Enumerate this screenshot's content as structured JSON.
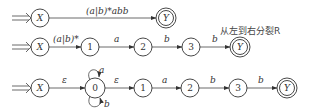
{
  "note": "从左到右分裂R",
  "rows": [
    {
      "nodes": [
        {
          "id": "X",
          "label": "X",
          "x": 40,
          "y": 18,
          "final": false,
          "start": true
        },
        {
          "id": "Y",
          "label": "Y",
          "x": 166,
          "y": 18,
          "final": true
        }
      ],
      "edges": [
        {
          "from": "X",
          "to": "Y",
          "label": "(a|b)*abb"
        }
      ]
    },
    {
      "nodes": [
        {
          "id": "X",
          "label": "X",
          "x": 40,
          "y": 47,
          "final": false,
          "start": true
        },
        {
          "id": "1",
          "label": "1",
          "x": 90,
          "y": 47
        },
        {
          "id": "2",
          "label": "2",
          "x": 143,
          "y": 47
        },
        {
          "id": "3",
          "label": "3",
          "x": 191,
          "y": 47
        },
        {
          "id": "Y",
          "label": "Y",
          "x": 240,
          "y": 47,
          "final": true
        }
      ],
      "edges": [
        {
          "from": "X",
          "to": "1",
          "label": "(a|b)*"
        },
        {
          "from": "1",
          "to": "2",
          "label": "a"
        },
        {
          "from": "2",
          "to": "3",
          "label": "b"
        },
        {
          "from": "3",
          "to": "Y",
          "label": "b"
        }
      ]
    },
    {
      "nodes": [
        {
          "id": "X",
          "label": "X",
          "x": 40,
          "y": 88,
          "final": false,
          "start": true
        },
        {
          "id": "0",
          "label": "0",
          "x": 95,
          "y": 88
        },
        {
          "id": "1",
          "label": "1",
          "x": 143,
          "y": 88
        },
        {
          "id": "2",
          "label": "2",
          "x": 190,
          "y": 88
        },
        {
          "id": "3",
          "label": "3",
          "x": 238,
          "y": 88
        },
        {
          "id": "Y",
          "label": "Y",
          "x": 287,
          "y": 88,
          "final": true
        }
      ],
      "edges": [
        {
          "from": "X",
          "to": "0",
          "label": "ε"
        },
        {
          "from": "0",
          "to": "0",
          "label": "a",
          "loop": "top"
        },
        {
          "from": "0",
          "to": "0",
          "label": "b",
          "loop": "bottom"
        },
        {
          "from": "0",
          "to": "1",
          "label": "ε"
        },
        {
          "from": "1",
          "to": "2",
          "label": "a"
        },
        {
          "from": "2",
          "to": "3",
          "label": "b"
        },
        {
          "from": "3",
          "to": "Y",
          "label": "b"
        }
      ]
    }
  ]
}
